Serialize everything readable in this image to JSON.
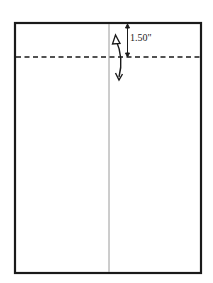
{
  "diagram": {
    "type": "fold-instruction",
    "page": {
      "x": 14,
      "y": 22,
      "width": 188,
      "height": 252,
      "stroke": "#1a1a1a"
    },
    "center_line": {
      "x": 109,
      "color": "#9a9a9a"
    },
    "fold_line": {
      "y": 57,
      "style": "dashed",
      "color": "#1a1a1a"
    },
    "dimension": {
      "label": "1.50\"",
      "from_y": 23,
      "to_y": 57,
      "x": 127
    },
    "fold_arrow": {
      "icon": "curved-double-arrow-icon"
    }
  }
}
